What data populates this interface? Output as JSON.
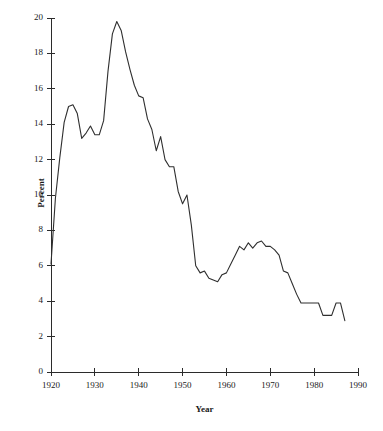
{
  "chart_data": {
    "type": "line",
    "title": "",
    "subtitle": "",
    "xlabel": "Year",
    "ylabel": "Percent",
    "xlim": [
      1920,
      1990
    ],
    "ylim": [
      0,
      20
    ],
    "xticks": [
      1920,
      1930,
      1940,
      1950,
      1960,
      1970,
      1980,
      1990
    ],
    "xtick_labels": [
      "1920",
      "1930",
      "1940",
      "1950",
      "1960",
      "1970",
      "1980",
      "1990"
    ],
    "yticks": [
      0,
      2,
      4,
      6,
      8,
      10,
      12,
      14,
      16,
      18,
      20
    ],
    "ytick_labels": [
      "0",
      "2",
      "4",
      "6",
      "8",
      "10",
      "12",
      "14",
      "16",
      "18",
      "20"
    ],
    "grid": false,
    "legend": false,
    "legend_position": "none",
    "line_color": "#2f2f2f",
    "series": [
      {
        "name": "Percent",
        "x": [
          1920,
          1921,
          1922,
          1923,
          1924,
          1925,
          1926,
          1927,
          1928,
          1929,
          1930,
          1931,
          1932,
          1933,
          1934,
          1935,
          1936,
          1937,
          1938,
          1939,
          1940,
          1941,
          1942,
          1943,
          1944,
          1945,
          1946,
          1947,
          1948,
          1949,
          1950,
          1951,
          1952,
          1953,
          1954,
          1955,
          1956,
          1957,
          1958,
          1959,
          1960,
          1961,
          1962,
          1963,
          1964,
          1965,
          1966,
          1967,
          1968,
          1969,
          1970,
          1971,
          1972,
          1973,
          1974,
          1975,
          1976,
          1977,
          1978,
          1979,
          1980,
          1981,
          1982,
          1983,
          1984,
          1985,
          1986,
          1987
        ],
        "values": [
          6.1,
          9.8,
          12.1,
          14.1,
          15.0,
          15.1,
          14.6,
          13.2,
          13.5,
          13.9,
          13.4,
          13.4,
          14.2,
          17.0,
          19.1,
          19.8,
          19.3,
          18.1,
          17.1,
          16.2,
          15.6,
          15.5,
          14.3,
          13.7,
          12.5,
          13.3,
          12.0,
          11.6,
          11.6,
          10.2,
          9.5,
          10.0,
          8.3,
          6.0,
          5.6,
          5.7,
          5.3,
          5.2,
          5.1,
          5.5,
          5.6,
          6.1,
          6.6,
          7.1,
          6.9,
          7.3,
          7.0,
          7.3,
          7.4,
          7.1,
          7.1,
          6.9,
          6.6,
          5.7,
          5.6,
          5.0,
          4.4,
          3.9,
          3.9,
          3.9,
          3.9,
          3.9,
          3.2,
          3.2,
          3.2,
          3.9,
          3.9,
          2.9
        ]
      }
    ]
  },
  "axes": {
    "y_axis_name": "percent-axis",
    "x_axis_name": "year-axis"
  }
}
